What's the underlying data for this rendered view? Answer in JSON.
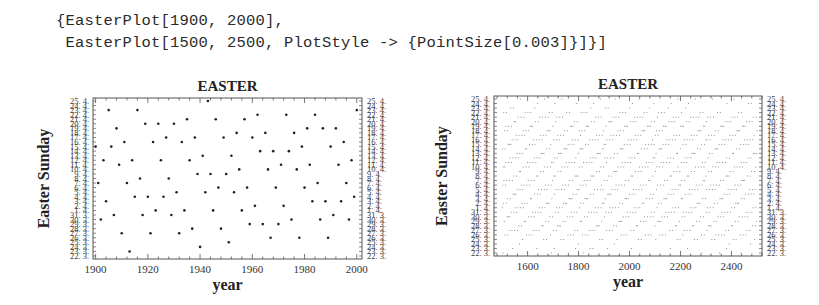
{
  "input_code": {
    "line1": "{EasterPlot[1900, 2000],",
    "line2": " EasterPlot[1500, 2500, PlotStyle -> {PointSize[0.003]}]}]"
  },
  "colors": {
    "frame": "#555555",
    "point": "#222222",
    "point_dense": "#777777",
    "text": "#222222"
  },
  "chart_data": [
    {
      "type": "scatter",
      "title": "EASTER",
      "xlabel": "year",
      "ylabel": "Easter Sunday",
      "xlim": [
        1899,
        2002
      ],
      "x_ticks": [
        1900,
        1920,
        1940,
        1960,
        1980,
        2000
      ],
      "y_axis": {
        "min_label": "22. 3.",
        "max_label": "25. 4.",
        "range": [
          "March 22",
          "April 25"
        ],
        "encoding": "days after March 22 (0..34)"
      },
      "y_tick_labels": [
        "25. 4.",
        "24. 4.",
        "23. 4.",
        "22. 4.",
        "21. 4.",
        "20. 4.",
        "19. 4.",
        "18. 4.",
        "17. 4.",
        "16. 4.",
        "15. 4.",
        "14. 4.",
        "13. 4.",
        "12. 4.",
        "11. 4.",
        "10. 4.",
        "9. 4.",
        "8. 4.",
        "7. 4.",
        "6. 4.",
        "5. 4.",
        "4. 4.",
        "3. 4.",
        "2. 4.",
        "1. 4.",
        "31. 3.",
        "30. 3.",
        "29. 3.",
        "28. 3.",
        "27. 3.",
        "26. 3.",
        "25. 3.",
        "24. 3.",
        "23. 3.",
        "22. 3."
      ],
      "frame": {
        "left": 93,
        "top": 98,
        "right": 362,
        "bottom": 259
      },
      "x": [
        1900,
        1901,
        1902,
        1903,
        1904,
        1905,
        1906,
        1907,
        1908,
        1909,
        1910,
        1911,
        1912,
        1913,
        1914,
        1915,
        1916,
        1917,
        1918,
        1919,
        1920,
        1921,
        1922,
        1923,
        1924,
        1925,
        1926,
        1927,
        1928,
        1929,
        1930,
        1931,
        1932,
        1933,
        1934,
        1935,
        1936,
        1937,
        1938,
        1939,
        1940,
        1941,
        1942,
        1943,
        1944,
        1945,
        1946,
        1947,
        1948,
        1949,
        1950,
        1951,
        1952,
        1953,
        1954,
        1955,
        1956,
        1957,
        1958,
        1959,
        1960,
        1961,
        1962,
        1963,
        1964,
        1965,
        1966,
        1967,
        1968,
        1969,
        1970,
        1971,
        1972,
        1973,
        1974,
        1975,
        1976,
        1977,
        1978,
        1979,
        1980,
        1981,
        1982,
        1983,
        1984,
        1985,
        1986,
        1987,
        1988,
        1989,
        1990,
        1991,
        1992,
        1993,
        1994,
        1995,
        1996,
        1997,
        1998,
        1999,
        2000
      ],
      "y": [
        24,
        16,
        8,
        21,
        12,
        32,
        24,
        9,
        28,
        20,
        5,
        25,
        16,
        1,
        21,
        13,
        32,
        17,
        9,
        29,
        13,
        5,
        25,
        10,
        29,
        21,
        13,
        26,
        17,
        9,
        29,
        14,
        5,
        25,
        10,
        30,
        21,
        6,
        26,
        18,
        2,
        22,
        14,
        34,
        18,
        10,
        30,
        15,
        6,
        26,
        18,
        3,
        22,
        14,
        27,
        19,
        10,
        30,
        15,
        7,
        26,
        11,
        31,
        23,
        7,
        27,
        19,
        4,
        23,
        15,
        7,
        20,
        11,
        31,
        23,
        8,
        27,
        19,
        4,
        24,
        15,
        28,
        20,
        12,
        31,
        16,
        8,
        28,
        12,
        4,
        24,
        9,
        28,
        20,
        12,
        25,
        16,
        8,
        21,
        13,
        32
      ]
    },
    {
      "type": "scatter",
      "title": "EASTER",
      "xlabel": "year",
      "ylabel": "Easter Sunday",
      "xlim": [
        1468,
        2520
      ],
      "x_ticks": [
        1600,
        1800,
        2000,
        2200,
        2400
      ],
      "y_axis": {
        "min_label": "22. 3.",
        "max_label": "25. 4.",
        "range": [
          "March 22",
          "April 25"
        ],
        "encoding": "days after March 22 (0..34)"
      },
      "frame": {
        "left": 494,
        "top": 96,
        "right": 762,
        "bottom": 256
      },
      "year_range": [
        1500,
        2500
      ],
      "point_size": 0.003,
      "series_note": "Gregorian Easter date for every year 1500-2500"
    }
  ]
}
